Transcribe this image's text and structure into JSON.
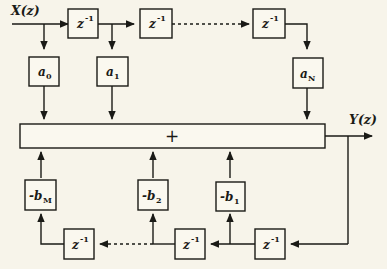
{
  "diagram": {
    "background_color": "#f7f4ea",
    "line_color": "#1a1a16",
    "box_fill": "#faf8ef",
    "input_label": "X(z)",
    "output_label": "Y(z)",
    "sum_symbol": "+",
    "delay_label_base": "z",
    "delay_label_exp": "-1",
    "feedforward_taps": [
      {
        "name": "a0",
        "base": "a",
        "sub": "0"
      },
      {
        "name": "a1",
        "base": "a",
        "sub": "1"
      },
      {
        "name": "aN",
        "base": "a",
        "sub": "N"
      }
    ],
    "feedback_taps": [
      {
        "name": "-bM",
        "base": "-b",
        "sub": "M"
      },
      {
        "name": "-b2",
        "base": "-b",
        "sub": "2"
      },
      {
        "name": "-b1",
        "base": "-b",
        "sub": "1"
      }
    ],
    "forward_delays": [
      {
        "name": "forward-delay-1"
      },
      {
        "name": "forward-delay-2"
      },
      {
        "name": "forward-delay-n"
      }
    ],
    "feedback_delays": [
      {
        "name": "feedback-delay-m"
      },
      {
        "name": "feedback-delay-2"
      },
      {
        "name": "feedback-delay-1"
      }
    ]
  }
}
